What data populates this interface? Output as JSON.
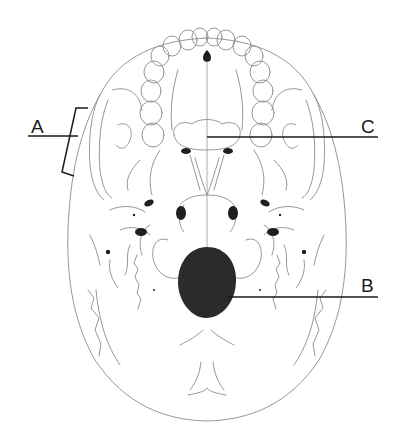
{
  "figure": {
    "labels": [
      {
        "id": "A",
        "text": "A",
        "points_to": "zygomatic arch (bracketed)"
      },
      {
        "id": "B",
        "text": "B",
        "points_to": "foramen magnum"
      },
      {
        "id": "C",
        "text": "C",
        "points_to": "posterior palate / vomer region"
      }
    ]
  },
  "labels": {
    "a": "A",
    "b": "B",
    "c": "C"
  },
  "colors": {
    "line_art": "#8a8a8a",
    "leader_lines": "#1a1a1a",
    "foramen_fill": "#2b2b2b",
    "background": "#ffffff"
  }
}
